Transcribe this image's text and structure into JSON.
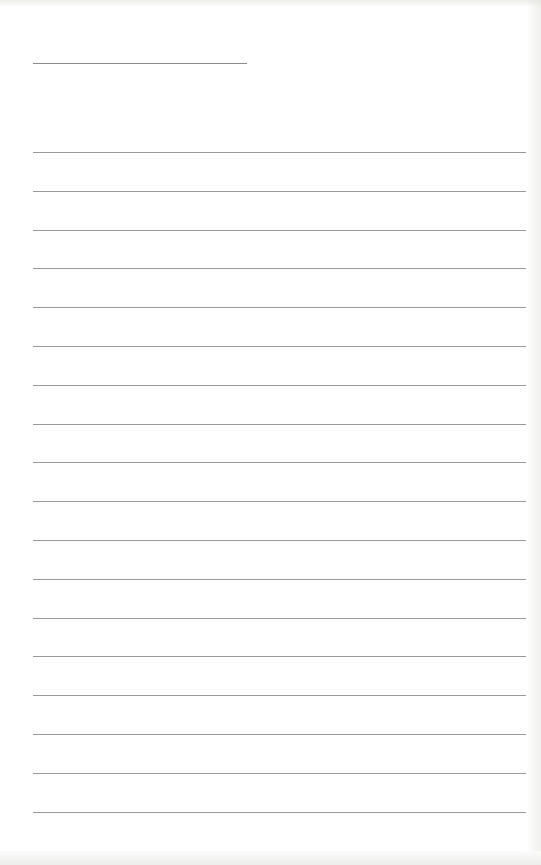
{
  "page": {
    "type": "ruled-notebook-page",
    "label": "",
    "title_line": {
      "x": 33,
      "y": 63,
      "width": 214
    },
    "ruled_lines": {
      "count": 18,
      "x": 33,
      "width": 493,
      "first_y": 152,
      "spacing": 38.8
    },
    "colors": {
      "paper": "#ffffff",
      "line": "#9a9a9a",
      "title_line": "#8c8c8c"
    }
  }
}
